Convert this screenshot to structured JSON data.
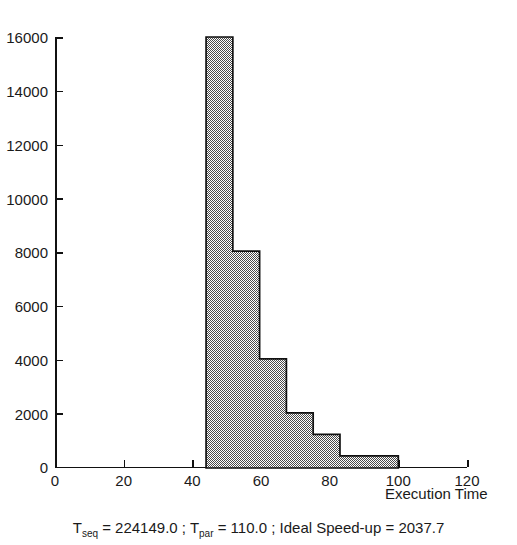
{
  "chart_data": {
    "type": "bar",
    "title": "",
    "subtitle": "",
    "xlabel": "Execution Time",
    "ylabel": "",
    "xlim": [
      0,
      120
    ],
    "ylim": [
      0,
      16000
    ],
    "grid": false,
    "legend": null,
    "style": {
      "fill": "#9a9a9a",
      "fill_pattern": "50% checkerboard dither (black/white)",
      "edge": "#111111",
      "background": "#ffffff"
    },
    "xticks": [
      0,
      20,
      40,
      60,
      80,
      100,
      120
    ],
    "xtick_labels": [
      "0",
      "20",
      "40",
      "60",
      "80",
      "100",
      "120"
    ],
    "yticks": [
      0,
      2000,
      4000,
      6000,
      8000,
      10000,
      12000,
      14000,
      16000
    ],
    "ytick_labels": [
      "0",
      "2000",
      "4000",
      "6000",
      "8000",
      "10000",
      "12000",
      "14000",
      "16000"
    ],
    "bin_edges": [
      44,
      51.8,
      59.6,
      67.4,
      75.2,
      83,
      100
    ],
    "bin_labels": [
      "44-51.8",
      "51.8-59.6",
      "59.6-67.4",
      "67.4-75.2",
      "75.2-83",
      "83-100"
    ],
    "values": [
      16000,
      8050,
      4050,
      2050,
      1250,
      450
    ],
    "annotations": [
      "T_seq = 224149.0",
      "T_par = 110.0",
      "Ideal Speed-up = 2037.7"
    ]
  },
  "axis": {
    "x_title": "Execution Time"
  },
  "caption": {
    "t_seq_symbol": "T",
    "t_seq_sub": "seq",
    "t_seq_value": " = 224149.0 ; ",
    "t_par_symbol": "T",
    "t_par_sub": "par",
    "t_par_value": " = 110.0 ; ",
    "speedup_text": "Ideal Speed-up = 2037.7",
    "full_text": "T seq = 224149.0 ; T par = 110.0 ; Ideal Speed-up = 2037.7"
  }
}
